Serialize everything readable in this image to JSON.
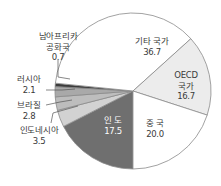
{
  "chart_data": {
    "type": "pie",
    "title": "",
    "unit": "%",
    "start_angle_deg_clockwise_from_top": 180,
    "direction": "clockwise",
    "slices": [
      {
        "label": "인도",
        "display_label": "인 도",
        "value": 17.5,
        "color": "#6f6f6f"
      },
      {
        "label": "인도네시아",
        "value": 3.5,
        "color": "#d2d2d2"
      },
      {
        "label": "브라질",
        "value": 2.8,
        "color": "#bdbdbd"
      },
      {
        "label": "러시아",
        "value": 2.1,
        "color": "#a9a9a9"
      },
      {
        "label": "남아프리카 공화국",
        "value": 0.7,
        "color": "#3c3c3c"
      },
      {
        "label": "기타 국가",
        "value": 36.7,
        "color": "#ffffff"
      },
      {
        "label": "OECD 국가",
        "value": 16.7,
        "color": "#ececec"
      },
      {
        "label": "중국",
        "display_label": "중 국",
        "value": 20.0,
        "color": "#ffffff"
      }
    ]
  },
  "labels": {
    "india": {
      "name": "인 도",
      "value": "17.5"
    },
    "indonesia": {
      "name": "인도네시아",
      "value": "3.5"
    },
    "brazil": {
      "name": "브라질",
      "value": "2.8"
    },
    "russia": {
      "name": "러시아",
      "value": "2.1"
    },
    "south_africa": {
      "name1": "남아프리카",
      "name2": "공화국",
      "value": "0.7"
    },
    "other": {
      "name": "기타 국가",
      "value": "36.7"
    },
    "oecd": {
      "name1": "OECD",
      "name2": "국가",
      "value": "16.7"
    },
    "china": {
      "name": "중 국",
      "value": "20.0"
    }
  }
}
